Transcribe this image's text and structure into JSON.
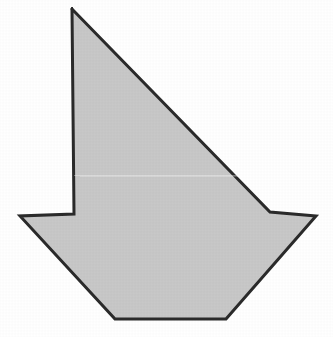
{
  "figure": {
    "shape_name": "concave-octagon-sailboat",
    "canvas": {
      "width": 333,
      "height": 337
    },
    "background_color": "#FFFFFF",
    "fill_color": "#C8C8C8",
    "stroke_color": "#2B2B2B",
    "stroke_width": 3,
    "vertex_count": 8,
    "vertices": [
      {
        "label": "sail-apex",
        "x": 71,
        "y": 8
      },
      {
        "label": "sail-lower-right",
        "x": 270,
        "y": 212
      },
      {
        "label": "right-wing-tip",
        "x": 316,
        "y": 216
      },
      {
        "label": "hull-bottom-right",
        "x": 226,
        "y": 319
      },
      {
        "label": "hull-bottom-left",
        "x": 115,
        "y": 319
      },
      {
        "label": "left-wing-tip",
        "x": 20,
        "y": 216
      },
      {
        "label": "mast-base",
        "x": 74,
        "y": 214
      },
      {
        "label": "mast-top",
        "x": 72,
        "y": 9
      }
    ],
    "points_attr": "71,8 270,212 316,216 226,319 115,319 20,216 74,214 72,9"
  }
}
